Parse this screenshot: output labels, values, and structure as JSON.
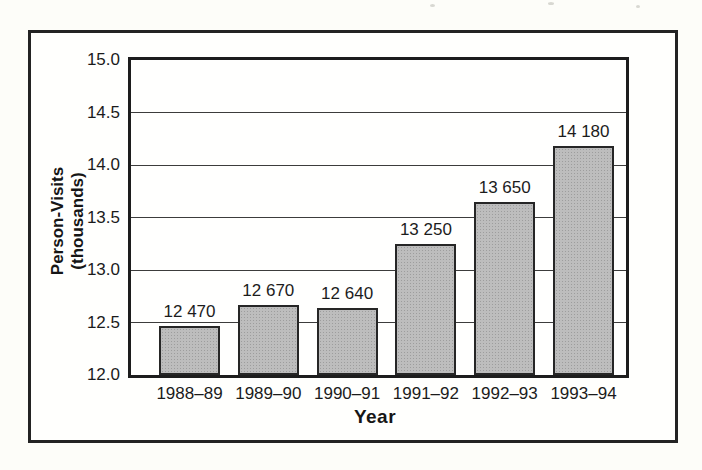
{
  "figure": {
    "background_color": "#fdfdf9",
    "frame_border_color": "#232323",
    "plot_border_color": "#1d1d1d",
    "gridline_color": "#3c3c3c",
    "bar_fill_color": "#bdbdbd",
    "bar_border_color": "#262626",
    "text_color": "#1b1b1b"
  },
  "chart_data": {
    "type": "bar",
    "title": "",
    "xlabel": "Year",
    "ylabel": "Person-Visits (thousands)",
    "ylabel_lines": [
      "Person-Visits",
      "(thousands)"
    ],
    "categories": [
      "1988–89",
      "1989–90",
      "1990–91",
      "1991–92",
      "1992–93",
      "1993–94"
    ],
    "values": [
      12470,
      12670,
      12640,
      13250,
      13650,
      14180
    ],
    "value_labels": [
      "12 470",
      "12 670",
      "12 640",
      "13 250",
      "13 650",
      "14 180"
    ],
    "values_unit": "persons (bar labels in absolute person-visits; axis in thousands)",
    "y_ticks": [
      12.0,
      12.5,
      13.0,
      13.5,
      14.0,
      14.5,
      15.0
    ],
    "y_tick_labels": [
      "12.0",
      "12.5",
      "13.0",
      "13.5",
      "14.0",
      "14.5",
      "15.0"
    ],
    "ylim": [
      12.0,
      15.0
    ],
    "grid": true,
    "legend": null
  }
}
